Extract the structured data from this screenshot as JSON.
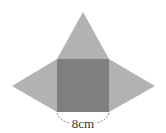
{
  "diagram": {
    "type": "pyramid-net",
    "colors": {
      "square_fill": "#7f7f7f",
      "triangle_fill": "#b2b2b2",
      "dimension_line": "#666666",
      "label_text": "#333333",
      "background": "#ffffff"
    },
    "square": {
      "x": 57,
      "y": 59,
      "size": 52
    },
    "triangles": {
      "top": {
        "apex": [
          83,
          12
        ]
      },
      "left": {
        "apex": [
          12,
          86
        ]
      },
      "right": {
        "apex": [
          155,
          86
        ]
      }
    },
    "dimension": {
      "label": "8cm",
      "value": 8,
      "unit": "cm",
      "side": "bottom"
    }
  }
}
